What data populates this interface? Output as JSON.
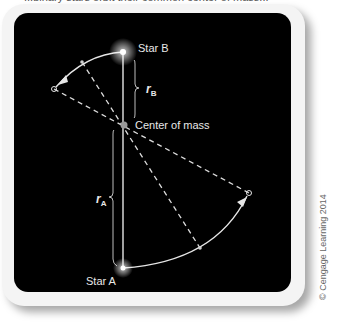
{
  "caption_fragment": "...binary stars orbit their common center of mass...",
  "labels": {
    "star_b": "Star B",
    "star_a": "Star A",
    "center_of_mass": "Center of mass",
    "r_b": "r",
    "r_b_sub": "B",
    "r_a": "r",
    "r_a_sub": "A"
  },
  "credit": "© Cengage Learning 2014",
  "colors": {
    "panel_bg": "#000000",
    "card_bg": "#f4f4f4",
    "line": "#e6e6e6",
    "label": "#e8e8e8"
  },
  "geometry": {
    "star_b": [
      123,
      52
    ],
    "center_of_mass": [
      124,
      125
    ],
    "star_a": [
      123,
      268
    ],
    "orbit_b_end": [
      54,
      89
    ],
    "orbit_b_mid": [
      82,
      62
    ],
    "orbit_a_end": [
      249,
      193
    ],
    "orbit_a_mid": [
      200,
      248
    ]
  }
}
